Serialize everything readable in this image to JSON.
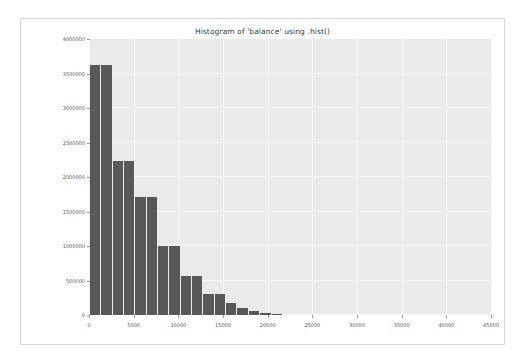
{
  "figure": {
    "title": "Histogram of 'balance' using .hist()",
    "background_color": "#ffffff",
    "frame_border_color": "#d8d8d8",
    "plot_background_color": "#eaeaea",
    "gridline_color": "#f7f7f7",
    "bar_color": "#585858",
    "tick_label_color": "#555555"
  },
  "chart_data": {
    "type": "bar",
    "subtype": "histogram",
    "title": "Histogram of 'balance' using .hist()",
    "xlabel": "",
    "ylabel": "",
    "xlim": [
      0,
      45000
    ],
    "ylim": [
      0,
      4000000
    ],
    "grid": true,
    "legend": false,
    "legend_position": "none",
    "xticks": [
      0,
      5000,
      10000,
      15000,
      20000,
      25000,
      30000,
      35000,
      40000,
      45000
    ],
    "xtick_labels": [
      "0",
      "5000",
      "10000",
      "15000",
      "20000",
      "25000",
      "30000",
      "35000",
      "40000",
      "45000"
    ],
    "yticks": [
      0,
      500000,
      1000000,
      1500000,
      2000000,
      2500000,
      3000000,
      3500000,
      4000000
    ],
    "ytick_labels": [
      "0",
      "500000",
      "1000000",
      "1500000",
      "2000000",
      "2500000",
      "3000000",
      "3500000",
      "4000000"
    ],
    "bin_width": 1270,
    "bin_edges": [
      0,
      1270,
      2540,
      3810,
      5080,
      6350,
      7620,
      8890,
      10160,
      11430,
      12700,
      13970,
      15240,
      16510,
      17780,
      19050,
      20320,
      21590
    ],
    "bin_centers": [
      635,
      1905,
      3175,
      4445,
      5715,
      6985,
      8255,
      9525,
      10795,
      12065,
      13335,
      14605,
      15875,
      17145,
      18415,
      19685,
      20955
    ],
    "values": [
      3630000,
      2230000,
      1710000,
      1710000,
      1000000,
      1000000,
      570000,
      570000,
      310000,
      310000,
      170000,
      170000,
      100000,
      55000,
      25000,
      12000,
      4000
    ],
    "bars": [
      {
        "x0": 0,
        "x1": 1270,
        "height": 3630000
      },
      {
        "x0": 1270,
        "x1": 2540,
        "height": 3630000
      },
      {
        "x0": 2540,
        "x1": 3810,
        "height": 2230000
      },
      {
        "x0": 3810,
        "x1": 5080,
        "height": 2230000
      },
      {
        "x0": 5080,
        "x1": 6350,
        "height": 1710000
      },
      {
        "x0": 6350,
        "x1": 7620,
        "height": 1710000
      },
      {
        "x0": 7620,
        "x1": 8890,
        "height": 1000000
      },
      {
        "x0": 8890,
        "x1": 10160,
        "height": 1000000
      },
      {
        "x0": 10160,
        "x1": 11430,
        "height": 570000
      },
      {
        "x0": 11430,
        "x1": 12700,
        "height": 570000
      },
      {
        "x0": 12700,
        "x1": 13970,
        "height": 310000
      },
      {
        "x0": 13970,
        "x1": 15240,
        "height": 310000
      },
      {
        "x0": 15240,
        "x1": 16510,
        "height": 170000
      },
      {
        "x0": 16510,
        "x1": 17780,
        "height": 100000
      },
      {
        "x0": 17780,
        "x1": 19050,
        "height": 55000
      },
      {
        "x0": 19050,
        "x1": 20320,
        "height": 25000
      },
      {
        "x0": 20320,
        "x1": 21590,
        "height": 10000
      }
    ]
  }
}
